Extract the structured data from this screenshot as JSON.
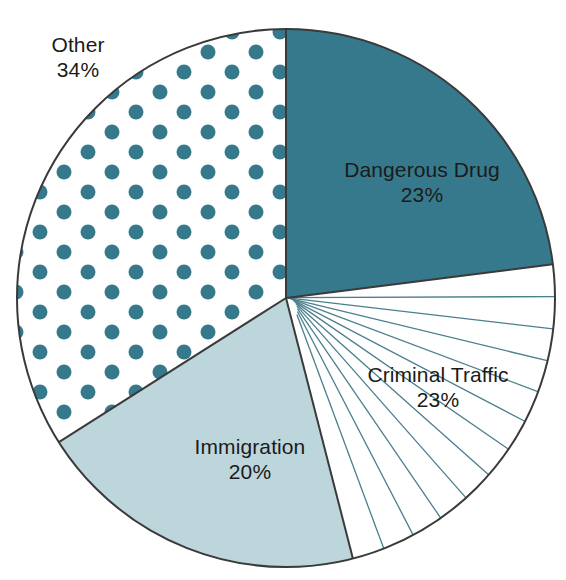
{
  "chart_data": {
    "type": "pie",
    "title": "",
    "subtitle": "",
    "xlabel": "",
    "ylabel": "",
    "legend_position": "none",
    "labels_inside": true,
    "categories": [
      "Dangerous Drug",
      "Criminal Traffic",
      "Immigration",
      "Other"
    ],
    "values": [
      23,
      23,
      20,
      34
    ],
    "units": "%",
    "slices": [
      {
        "label": "Dangerous Drug",
        "value": 23,
        "percent_text": "23%",
        "fill_style": "solid",
        "color": "#36798c",
        "start_angle_deg": 0,
        "end_angle_deg": 82.8
      },
      {
        "label": "Criminal Traffic",
        "value": 23,
        "percent_text": "23%",
        "fill_style": "radial-lines",
        "color": "#ffffff",
        "line_color": "#4a7f8e",
        "line_count": 11,
        "start_angle_deg": 82.8,
        "end_angle_deg": 165.6
      },
      {
        "label": "Immigration",
        "value": 20,
        "percent_text": "20%",
        "fill_style": "solid",
        "color": "#bdd6dc",
        "start_angle_deg": 165.6,
        "end_angle_deg": 237.6
      },
      {
        "label": "Other",
        "value": 34,
        "percent_text": "34%",
        "fill_style": "polka-dots",
        "color": "#ffffff",
        "dot_color": "#36798c",
        "start_angle_deg": 237.6,
        "end_angle_deg": 360
      }
    ],
    "outline_color": "#3a3a3a",
    "geometry": {
      "center_x": 286,
      "center_y": 298,
      "radius": 269
    }
  },
  "labels": {
    "other": {
      "name": "Other",
      "percent": "34%"
    },
    "dangerous": {
      "name": "Dangerous Drug",
      "percent": "23%"
    },
    "criminal": {
      "name": "Criminal Traffic",
      "percent": "23%"
    },
    "immigration": {
      "name": "Immigration",
      "percent": "20%"
    }
  }
}
